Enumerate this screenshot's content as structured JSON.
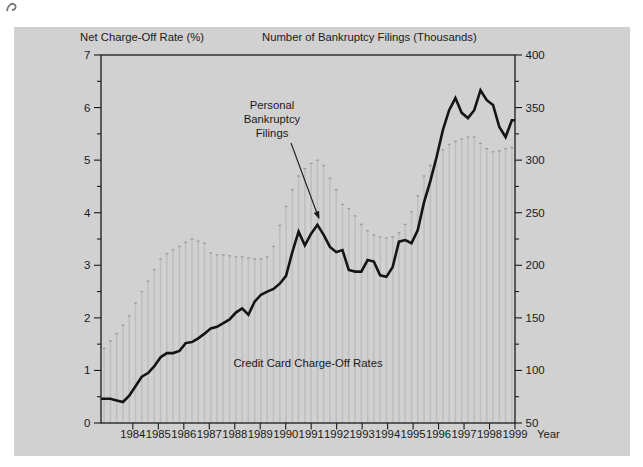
{
  "figure": {
    "left_axis_title": "Net Charge-Off Rate (%)",
    "right_axis_title": "Number of Bankruptcy Filings (Thousands)",
    "x_axis_unit_label": "Year",
    "bar_series_annotation_lines": [
      "Personal",
      "Bankruptcy",
      "Filings"
    ],
    "line_series_annotation": "Credit Card Charge-Off Rates"
  },
  "colors": {
    "page_background": "#ffffff",
    "panel_background": "#d1d1d1",
    "bar_fill": "#bfbfbf",
    "bar_cap": "#9a9a9a",
    "line_color": "#141414",
    "axis_color": "#1a1a1a",
    "text_color": "#1a1a1a"
  },
  "chart_data": {
    "type": "combo",
    "x_unit": "quarterly",
    "x_axis": {
      "start": 1983.25,
      "end": 1999.5,
      "tick_years": [
        1984,
        1985,
        1986,
        1987,
        1988,
        1989,
        1990,
        1991,
        1992,
        1993,
        1994,
        1995,
        1996,
        1997,
        1998,
        1999
      ]
    },
    "left_axis": {
      "title": "Net Charge-Off Rate (%)",
      "min": 0,
      "max": 7,
      "major_ticks": [
        0,
        1,
        2,
        3,
        4,
        5,
        6,
        7
      ],
      "minor_step": 0.5
    },
    "right_axis": {
      "title": "Number of Bankruptcy Filings (Thousands)",
      "min": 50,
      "max": 400,
      "major_ticks": [
        50,
        100,
        150,
        200,
        250,
        300,
        350,
        400
      ],
      "minor_step": 25
    },
    "series": [
      {
        "name": "Personal Bankruptcy Filings",
        "type": "bar",
        "axis": "right",
        "first_quarter": "1983Q2",
        "values": [
          121,
          128,
          135,
          143,
          152,
          164,
          175,
          185,
          196,
          206,
          211,
          215,
          218,
          222,
          225,
          223,
          221,
          212,
          210,
          210,
          209,
          208,
          208,
          207,
          206,
          206,
          208,
          218,
          238,
          256,
          272,
          285,
          292,
          297,
          300,
          295,
          283,
          272,
          258,
          254,
          247,
          239,
          233,
          229,
          227,
          226,
          227,
          231,
          239,
          251,
          266,
          285,
          295,
          303,
          310,
          315,
          318,
          320,
          322,
          322,
          316,
          311,
          308,
          309,
          311,
          312
        ]
      },
      {
        "name": "Credit Card Charge-Off Rates",
        "type": "line",
        "axis": "left",
        "first_quarter": "1983Q2",
        "values": [
          0.46,
          0.46,
          0.43,
          0.4,
          0.52,
          0.7,
          0.88,
          0.95,
          1.08,
          1.25,
          1.33,
          1.33,
          1.37,
          1.52,
          1.54,
          1.61,
          1.7,
          1.8,
          1.83,
          1.9,
          1.97,
          2.1,
          2.18,
          2.06,
          2.31,
          2.44,
          2.5,
          2.55,
          2.65,
          2.8,
          3.25,
          3.64,
          3.38,
          3.6,
          3.77,
          3.58,
          3.35,
          3.25,
          3.29,
          2.91,
          2.88,
          2.88,
          3.1,
          3.07,
          2.81,
          2.78,
          2.97,
          3.45,
          3.48,
          3.42,
          3.67,
          4.2,
          4.6,
          5.06,
          5.57,
          5.95,
          6.18,
          5.9,
          5.8,
          5.95,
          6.33,
          6.14,
          6.05,
          5.63,
          5.44,
          5.76
        ]
      }
    ],
    "title": "",
    "grid": false,
    "legend_position": "annotations-inside-plot"
  }
}
